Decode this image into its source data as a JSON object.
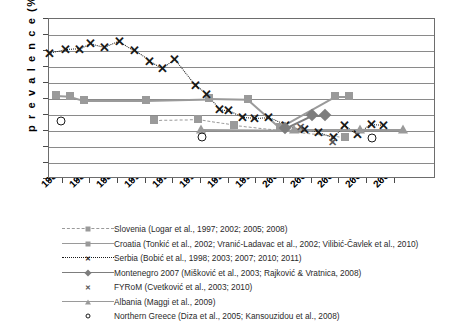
{
  "chart_data": {
    "type": "scatter",
    "title": "",
    "xlabel": "",
    "ylabel": "prevalence (%)",
    "ylim": [
      0,
      100
    ],
    "ytick_step": 10,
    "yticks": [
      100,
      90,
      80,
      70,
      60,
      50,
      40,
      30,
      20,
      10,
      0
    ],
    "xlim": [
      1984,
      2010
    ],
    "xticks": [
      1984,
      1986,
      1988,
      1990,
      1992,
      1994,
      1996,
      1998,
      2000,
      2002,
      2004,
      2006,
      2008
    ],
    "xtick_labels": [
      "1984",
      "1986",
      "1988",
      "1990",
      "1992",
      "1994",
      "1996",
      "1998",
      "2000",
      "2002",
      "2004",
      "2006",
      "2008"
    ],
    "grid": "horizontal",
    "legend_position": "below",
    "series": [
      {
        "name": "Slovenia (Logar et al., 1997; 2002; 2005; 2008)",
        "marker": "square",
        "line": "dashed",
        "color": "#9a9a9a",
        "points": [
          [
            1991.6,
            37.0
          ],
          [
            1994.8,
            37.5
          ],
          [
            1997.4,
            34.0
          ],
          [
            2005.4,
            26.5
          ]
        ]
      },
      {
        "name": "Croatia (Tonkić et al., 2002; Vranić-Ladavac et al., 2002; Vilibić-Čavlek et al., 2010)",
        "marker": "square",
        "line": "solid",
        "color": "#9a9a9a",
        "points": [
          [
            1984.5,
            52.5
          ],
          [
            1985.5,
            52.0
          ],
          [
            1986.5,
            49.5
          ],
          [
            1991.0,
            49.5
          ],
          [
            1995.6,
            50.5
          ],
          [
            1998.4,
            50.0
          ],
          [
            2000.7,
            32.5
          ],
          [
            2004.7,
            52.0
          ],
          [
            2005.7,
            52.0
          ]
        ]
      },
      {
        "name": "Serbia (Bobić et al., 1998; 2003; 2007; 2010; 2011)",
        "marker": "x",
        "line": "dotted",
        "color": "#1a1a1a",
        "points": [
          [
            1984.0,
            78.5
          ],
          [
            1985.2,
            81.0
          ],
          [
            1986.2,
            81.5
          ],
          [
            1987.0,
            85.0
          ],
          [
            1988.0,
            82.5
          ],
          [
            1989.1,
            86.5
          ],
          [
            1990.2,
            80.5
          ],
          [
            1991.3,
            74.0
          ],
          [
            1992.2,
            69.5
          ],
          [
            1993.1,
            75.0
          ],
          [
            1994.6,
            58.5
          ],
          [
            1995.4,
            53.0
          ],
          [
            1996.3,
            44.0
          ],
          [
            1997.0,
            43.0
          ],
          [
            1998.0,
            38.5
          ],
          [
            1998.9,
            38.0
          ],
          [
            1999.9,
            38.5
          ],
          [
            2001.1,
            34.0
          ],
          [
            2002.5,
            31.0
          ],
          [
            2003.5,
            29.5
          ],
          [
            2004.6,
            26.0
          ],
          [
            2005.4,
            34.0
          ],
          [
            2006.3,
            28.0
          ],
          [
            2007.3,
            34.5
          ],
          [
            2008.2,
            34.0
          ]
        ]
      },
      {
        "name": "Montenegro 2007 (Mišković et al., 2003; Rajković & Vratnica, 2008)",
        "marker": "diamond",
        "line": "solid",
        "color": "#7d7d7d",
        "points": [
          [
            2001.1,
            32.0
          ],
          [
            2003.0,
            40.0
          ],
          [
            2004.0,
            40.0
          ]
        ]
      },
      {
        "name": "FYRoM (Cvetković et al., 2003; 2010)",
        "marker": "x-gray",
        "line": "none",
        "color": "#555555",
        "points": [
          [
            2002.2,
            32.5
          ],
          [
            2004.5,
            23.0
          ]
        ]
      },
      {
        "name": "Albania (Maggi et al., 2009)",
        "marker": "triangle",
        "line": "solid",
        "color": "#9a9a9a",
        "points": [
          [
            1995.0,
            31.5
          ],
          [
            2001.7,
            31.0
          ],
          [
            2006.5,
            31.0
          ],
          [
            2009.6,
            31.0
          ]
        ]
      },
      {
        "name": "Northern Greece (Diza et al., 2005; Kansouzidou et al., 2008)",
        "marker": "circle-open",
        "line": "none",
        "color": "#1a1a1a",
        "points": [
          [
            1984.9,
            36.5
          ],
          [
            1995.1,
            26.5
          ],
          [
            2007.4,
            25.5
          ]
        ]
      }
    ]
  },
  "axis": {
    "y_title": "p r e v a l e n c e   (%)"
  },
  "legend": {
    "items": [
      {
        "label": "Slovenia (Logar et al., 1997; 2002; 2005; 2008)",
        "key": "dashed-square-key"
      },
      {
        "label": "Croatia (Tonkić et al., 2002; Vranić-Ladavac et al., 2002; Vilibić-Čavlek et al., 2010)",
        "key": "solid-square-key"
      },
      {
        "label": "Serbia (Bobić et al., 1998; 2003; 2007; 2010; 2011)",
        "key": "dotted-x-key"
      },
      {
        "label": "Montenegro 2007 (Mišković et al., 2003; Rajković & Vratnica, 2008)",
        "key": "solid-diamond-key"
      },
      {
        "label": "FYRoM (Cvetković et al., 2003; 2010)",
        "key": "x-marker-key"
      },
      {
        "label": "Albania (Maggi et al., 2009)",
        "key": "solid-triangle-key"
      },
      {
        "label": "Northern Greece (Diza et al., 2005; Kansouzidou et al., 2008)",
        "key": "circle-marker-key"
      }
    ]
  }
}
